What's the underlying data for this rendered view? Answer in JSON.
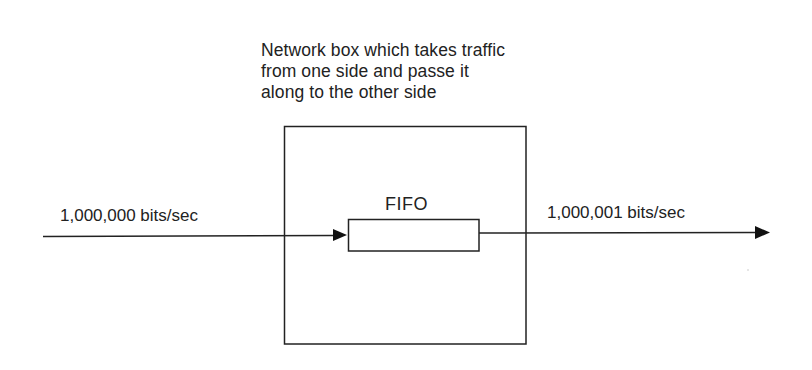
{
  "diagram": {
    "caption": {
      "lines": [
        "Network box which takes traffic",
        "from one side and passe it",
        "along to the other side"
      ]
    },
    "input": {
      "label": "1,000,000 bits/sec"
    },
    "output": {
      "label": "1,000,001 bits/sec"
    },
    "network_box": {
      "queue_label": "FIFO"
    },
    "colors": {
      "stroke": "#222222",
      "background": "#ffffff"
    }
  }
}
